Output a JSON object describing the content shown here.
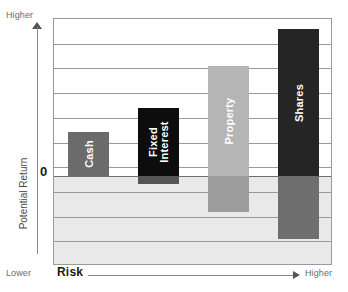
{
  "axes": {
    "y_top_label": "Higher",
    "y_bottom_label": "Lower",
    "y_zero_label": "0",
    "y_title": "Potential Return",
    "x_title": "Risk",
    "x_right_label": "Higher"
  },
  "chart_data": {
    "type": "bar",
    "title": "",
    "xlabel": "Risk",
    "ylabel": "Potential Return",
    "ylim": [
      -4,
      6
    ],
    "grid": true,
    "legend": "none",
    "axis_tick_labels": {
      "y": [
        "Higher",
        "0",
        "Lower"
      ],
      "x": [
        "Lower",
        "Higher"
      ]
    },
    "categories": [
      "Cash",
      "Fixed Interest",
      "Property",
      "Shares"
    ],
    "series": [
      {
        "name": "Potential return high",
        "values": [
          1.7,
          2.6,
          4.2,
          5.6
        ]
      },
      {
        "name": "Potential return low",
        "values": [
          0.0,
          -0.35,
          -1.6,
          -2.8
        ]
      }
    ],
    "bars": [
      {
        "label": "Cash",
        "label_lines": [
          "Cash"
        ],
        "high": 1.7,
        "low": 0.0,
        "color": "#6b6b6b",
        "negative_color": "#6b6b6b"
      },
      {
        "label": "Fixed Interest",
        "label_lines": [
          "Fixed",
          "Interest"
        ],
        "high": 2.6,
        "low": -0.35,
        "color": "#0d0d0d",
        "negative_color": "#555555"
      },
      {
        "label": "Property",
        "label_lines": [
          "Property"
        ],
        "high": 4.2,
        "low": -1.6,
        "color": "#b5b5b5",
        "negative_color": "#9d9d9d"
      },
      {
        "label": "Shares",
        "label_lines": [
          "Shares"
        ],
        "high": 5.6,
        "low": -2.8,
        "color": "#252525",
        "negative_color": "#6e6e6e"
      }
    ]
  },
  "colors": {
    "plot_border": "#9a9a9a",
    "gridline": "#9a9a9a",
    "zero_line": "#6e6e6e",
    "negative_zone": "#e9e9e9",
    "axis_text": "#6b6b6b",
    "title_text": "#1a1a1a"
  }
}
